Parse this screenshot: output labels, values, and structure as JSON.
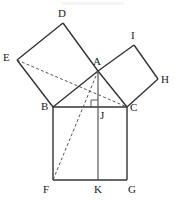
{
  "figure": {
    "width": 176,
    "height": 200,
    "background_color": "#ffffff",
    "stroke_color": "#333333",
    "dashed_stroke_color": "#555555",
    "label_color": "#1a1a1a"
  },
  "labels": {
    "A": "A",
    "B": "B",
    "C": "C",
    "D": "D",
    "E": "E",
    "F": "F",
    "G": "G",
    "H": "H",
    "I": "I",
    "J": "J",
    "K": "K"
  },
  "points": {
    "A": {
      "x": 98,
      "y": 71,
      "label": "A",
      "label_x": 93,
      "label_y": 56
    },
    "B": {
      "x": 53,
      "y": 107,
      "label": "B",
      "label_x": 41,
      "label_y": 101
    },
    "C": {
      "x": 127,
      "y": 107,
      "label": "C",
      "label_x": 130,
      "label_y": 102
    },
    "D": {
      "x": 63,
      "y": 23,
      "label": "D",
      "label_x": 58,
      "label_y": 8
    },
    "E": {
      "x": 17,
      "y": 60,
      "label": "E",
      "label_x": 3,
      "label_y": 52
    },
    "F": {
      "x": 53,
      "y": 180,
      "label": "F",
      "label_x": 43,
      "label_y": 184
    },
    "G": {
      "x": 127,
      "y": 180,
      "label": "G",
      "label_x": 128,
      "label_y": 184
    },
    "H": {
      "x": 158,
      "y": 79,
      "label": "H",
      "label_x": 161,
      "label_y": 74
    },
    "I": {
      "x": 134,
      "y": 45,
      "label": "I",
      "label_x": 131,
      "label_y": 30
    },
    "J": {
      "x": 98,
      "y": 107,
      "label": "J",
      "label_x": 100,
      "label_y": 110
    },
    "K": {
      "x": 98,
      "y": 180,
      "label": "K",
      "label_x": 94,
      "label_y": 184
    }
  },
  "shapes": {
    "triangle_ABC": {
      "name": "right-triangle",
      "vertices": "A,B,C",
      "right_angle_at": "A"
    },
    "square_on_AB": {
      "name": "square-ABDE",
      "vertices": "A,B,E,D"
    },
    "square_on_AC": {
      "name": "square-ACHI",
      "vertices": "A,C,H,I"
    },
    "square_on_BC": {
      "name": "square-BCGF",
      "vertices": "B,C,G,F"
    }
  },
  "solid_segments": [
    {
      "name": "segment-A-B",
      "from": "A",
      "to": "B"
    },
    {
      "name": "segment-B-C",
      "from": "B",
      "to": "C"
    },
    {
      "name": "segment-A-C",
      "from": "A",
      "to": "C"
    },
    {
      "name": "segment-B-E",
      "from": "B",
      "to": "E"
    },
    {
      "name": "segment-E-D",
      "from": "E",
      "to": "D"
    },
    {
      "name": "segment-D-A",
      "from": "D",
      "to": "A"
    },
    {
      "name": "segment-A-I",
      "from": "A",
      "to": "I"
    },
    {
      "name": "segment-I-H",
      "from": "I",
      "to": "H"
    },
    {
      "name": "segment-H-C",
      "from": "H",
      "to": "C"
    },
    {
      "name": "segment-B-F",
      "from": "B",
      "to": "F"
    },
    {
      "name": "segment-F-G",
      "from": "F",
      "to": "G"
    },
    {
      "name": "segment-G-C",
      "from": "G",
      "to": "C"
    },
    {
      "name": "segment-A-J-K-altitude",
      "from": "A",
      "to": "K"
    }
  ],
  "dashed_segments": [
    {
      "name": "segment-E-C",
      "from": "E",
      "to": "C"
    },
    {
      "name": "segment-A-F",
      "from": "A",
      "to": "F"
    }
  ],
  "markers": {
    "right_angle_at_J": {
      "name": "right-angle-marker",
      "x": 98,
      "y": 107,
      "size": 7
    }
  }
}
